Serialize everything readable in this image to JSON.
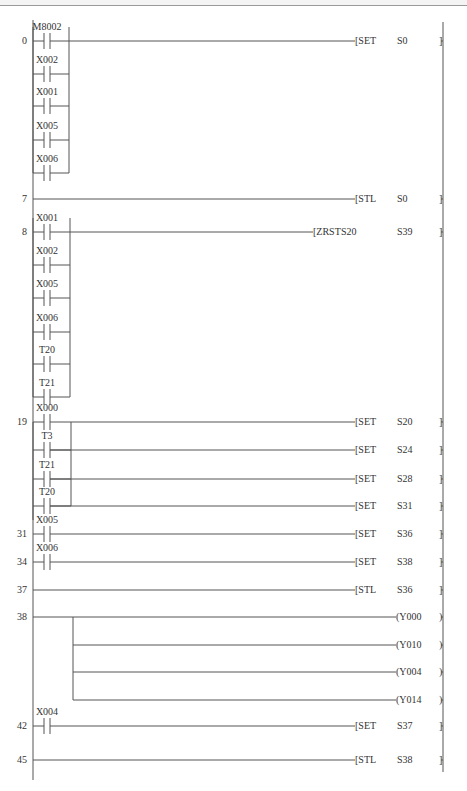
{
  "diagram": {
    "type": "ladder-logic",
    "left_rail_x": 33,
    "right_rail_x": 443,
    "rungs": [
      {
        "step": "0",
        "y": 41,
        "contacts": [
          {
            "label": "M8002",
            "y": 41
          },
          {
            "label": "X002",
            "y": 74
          },
          {
            "label": "X001",
            "y": 106
          },
          {
            "label": "X005",
            "y": 140
          },
          {
            "label": "X006",
            "y": 173
          }
        ],
        "branch_close_x": 69,
        "outputs": [
          {
            "kind": "instr",
            "op": "SET",
            "arg1": "S0",
            "arg2": "",
            "y": 41
          }
        ]
      },
      {
        "step": "7",
        "y": 199,
        "contacts": [],
        "outputs": [
          {
            "kind": "instr",
            "op": "STL",
            "arg1": "S0",
            "arg2": "",
            "y": 199
          }
        ]
      },
      {
        "step": "8",
        "y": 232,
        "contacts": [
          {
            "label": "X001",
            "y": 232
          },
          {
            "label": "X002",
            "y": 265
          },
          {
            "label": "X005",
            "y": 298
          },
          {
            "label": "X006",
            "y": 332
          },
          {
            "label": "T20",
            "y": 364
          },
          {
            "label": "T21",
            "y": 397
          }
        ],
        "branch_close_x": 70,
        "outputs": [
          {
            "kind": "instr",
            "op": "ZRST",
            "arg1": "S20",
            "arg2": "S39",
            "y": 232
          }
        ]
      },
      {
        "step": "19",
        "y": 422,
        "contacts": [
          {
            "label": "X000",
            "y": 422
          },
          {
            "label": "T3",
            "y": 450
          },
          {
            "label": "T21",
            "y": 479
          },
          {
            "label": "T20",
            "y": 506
          }
        ],
        "output_branch_x": 71,
        "outputs": [
          {
            "kind": "instr",
            "op": "SET",
            "arg1": "S20",
            "arg2": "",
            "y": 422
          },
          {
            "kind": "instr",
            "op": "SET",
            "arg1": "S24",
            "arg2": "",
            "y": 450
          },
          {
            "kind": "instr",
            "op": "SET",
            "arg1": "S28",
            "arg2": "",
            "y": 479
          },
          {
            "kind": "instr",
            "op": "SET",
            "arg1": "S31",
            "arg2": "",
            "y": 506
          }
        ]
      },
      {
        "step": "31",
        "y": 534,
        "contacts": [
          {
            "label": "X005",
            "y": 534
          }
        ],
        "outputs": [
          {
            "kind": "instr",
            "op": "SET",
            "arg1": "S36",
            "arg2": "",
            "y": 534
          }
        ]
      },
      {
        "step": "34",
        "y": 562,
        "contacts": [
          {
            "label": "X006",
            "y": 562
          }
        ],
        "outputs": [
          {
            "kind": "instr",
            "op": "SET",
            "arg1": "S38",
            "arg2": "",
            "y": 562
          }
        ]
      },
      {
        "step": "37",
        "y": 590,
        "contacts": [],
        "outputs": [
          {
            "kind": "instr",
            "op": "STL",
            "arg1": "S36",
            "arg2": "",
            "y": 590
          }
        ]
      },
      {
        "step": "38",
        "y": 617,
        "contacts": [],
        "output_branch_x": 73,
        "outputs": [
          {
            "kind": "coil",
            "op": "Y000",
            "y": 617
          },
          {
            "kind": "coil",
            "op": "Y010",
            "y": 645
          },
          {
            "kind": "coil",
            "op": "Y004",
            "y": 672
          },
          {
            "kind": "coil",
            "op": "Y014",
            "y": 700
          }
        ]
      },
      {
        "step": "42",
        "y": 726,
        "contacts": [
          {
            "label": "X004",
            "y": 726
          }
        ],
        "outputs": [
          {
            "kind": "instr",
            "op": "SET",
            "arg1": "S37",
            "arg2": "",
            "y": 726
          }
        ]
      },
      {
        "step": "45",
        "y": 760,
        "contacts": [],
        "outputs": [
          {
            "kind": "instr",
            "op": "STL",
            "arg1": "S38",
            "arg2": "",
            "y": 760
          }
        ]
      }
    ]
  }
}
